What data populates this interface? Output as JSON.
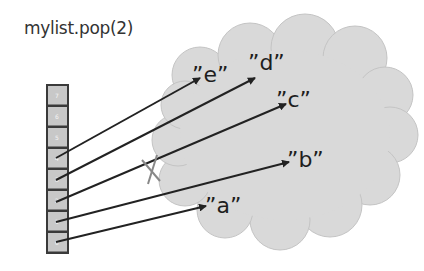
{
  "title": "mylist.pop(2)",
  "list": {
    "cells": [
      "7",
      "6",
      "5",
      "4",
      "3",
      "2",
      "1",
      "0"
    ]
  },
  "strings": {
    "e": "”e”",
    "d": "”d”",
    "c": "”c”",
    "b": "”b”",
    "a": "”a”"
  },
  "colors": {
    "cloud": "#d9d9d9",
    "cell": "#c8c8c8",
    "arrow": "#222222",
    "cross": "#888888"
  }
}
